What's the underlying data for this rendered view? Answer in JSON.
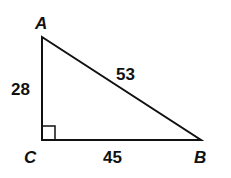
{
  "diagram": {
    "type": "right-triangle",
    "vertices": {
      "A": {
        "label": "A"
      },
      "B": {
        "label": "B"
      },
      "C": {
        "label": "C"
      }
    },
    "sides": {
      "AC": "28",
      "AB": "53",
      "CB": "45"
    },
    "right_angle_at": "C",
    "colors": {
      "stroke": "#111111",
      "background": "#ffffff"
    }
  }
}
